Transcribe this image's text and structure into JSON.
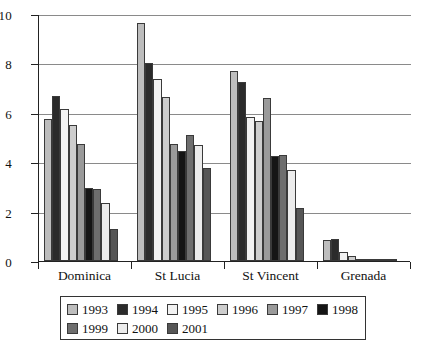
{
  "chart_data": {
    "type": "bar",
    "title": "",
    "subtitle": "",
    "xlabel": "",
    "ylabel": "",
    "ylim": [
      0,
      10
    ],
    "yticks": [
      0,
      2,
      4,
      6,
      8,
      10
    ],
    "ytick_labels": [
      "0",
      "2",
      "4",
      "6",
      "8",
      "10"
    ],
    "grid": true,
    "grid_axis": "y",
    "legend_position": "bottom",
    "categories": [
      "Dominica",
      "St Lucia",
      "St Vincent",
      "Grenada"
    ],
    "series": [
      {
        "name": "1993",
        "color": "#bdbdbd",
        "values": [
          5.75,
          9.65,
          7.7,
          0.85
        ]
      },
      {
        "name": "1994",
        "color": "#2b2b2b",
        "values": [
          6.7,
          8.0,
          7.25,
          0.9
        ]
      },
      {
        "name": "1995",
        "color": "#f2f2f2",
        "values": [
          6.15,
          7.35,
          5.85,
          0.35
        ]
      },
      {
        "name": "1996",
        "color": "#cdcdcd",
        "values": [
          5.5,
          6.65,
          5.65,
          0.2
        ]
      },
      {
        "name": "1997",
        "color": "#9a9a9a",
        "values": [
          4.75,
          4.75,
          6.6,
          0.05
        ]
      },
      {
        "name": "1998",
        "color": "#151515",
        "values": [
          2.95,
          4.45,
          4.25,
          0.08
        ]
      },
      {
        "name": "1999",
        "color": "#6e6e6e",
        "values": [
          2.9,
          5.1,
          4.3,
          0.05
        ]
      },
      {
        "name": "2000",
        "color": "#ececec",
        "values": [
          2.35,
          4.7,
          3.7,
          0.04
        ]
      },
      {
        "name": "2001",
        "color": "#565656",
        "values": [
          1.3,
          3.75,
          2.15,
          0.05
        ]
      }
    ]
  },
  "legend": {
    "rows": [
      [
        "1993",
        "1994",
        "1995",
        "1996",
        "1997",
        "1998"
      ],
      [
        "1999",
        "2000",
        "2001"
      ]
    ]
  }
}
